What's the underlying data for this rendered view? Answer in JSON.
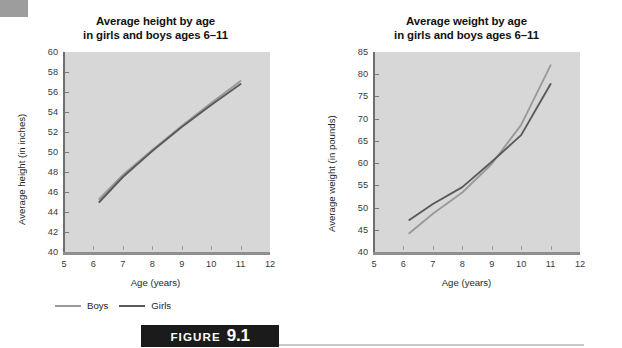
{
  "figure": {
    "word": "FIGURE",
    "number": "9.1"
  },
  "legend": {
    "items": [
      {
        "label": "Boys",
        "color": "#9a9a9a"
      },
      {
        "label": "Girls",
        "color": "#5a5a5a"
      }
    ]
  },
  "colors": {
    "plot_background": "#d7d7d7",
    "boys_line": "#9a9a9a",
    "girls_line": "#5a5a5a",
    "axis": "#6f6f6f",
    "banner": "#1b1b1b"
  },
  "chart_data": [
    {
      "type": "line",
      "id": "height-by-age",
      "title": "Average height by age\nin girls and boys ages 6–11",
      "title_line1": "Average height by age",
      "title_line2": "in girls and boys ages 6–11",
      "xlabel": "Age (years)",
      "ylabel": "Average height (in inches)",
      "xlim": [
        5,
        12
      ],
      "ylim": [
        40,
        60
      ],
      "xticks": [
        5,
        6,
        7,
        8,
        9,
        10,
        11,
        12
      ],
      "yticks": [
        40,
        42,
        44,
        46,
        48,
        50,
        52,
        54,
        56,
        58,
        60
      ],
      "grid": false,
      "legend_position": "below-left",
      "x": [
        6.2,
        7,
        8,
        9,
        10,
        11
      ],
      "series": [
        {
          "name": "Boys",
          "values": [
            45.3,
            47.7,
            50.2,
            52.6,
            54.9,
            57.1
          ]
        },
        {
          "name": "Girls",
          "values": [
            45.0,
            47.5,
            50.1,
            52.5,
            54.7,
            56.8
          ]
        }
      ]
    },
    {
      "type": "line",
      "id": "weight-by-age",
      "title": "Average weight by age\nin girls and boys ages 6–11",
      "title_line1": "Average weight by age",
      "title_line2": "in girls and boys ages 6–11",
      "xlabel": "Age (years)",
      "ylabel": "Average weight (in pounds)",
      "xlim": [
        5,
        12
      ],
      "ylim": [
        40,
        85
      ],
      "xticks": [
        5,
        6,
        7,
        8,
        9,
        10,
        11,
        12
      ],
      "yticks": [
        40,
        45,
        50,
        55,
        60,
        65,
        70,
        75,
        80,
        85
      ],
      "grid": false,
      "legend_position": "below-left",
      "x": [
        6.2,
        7,
        8,
        9,
        10,
        11
      ],
      "series": [
        {
          "name": "Boys",
          "values": [
            44.2,
            48.6,
            53.4,
            59.8,
            68.6,
            82.0
          ]
        },
        {
          "name": "Girls",
          "values": [
            47.2,
            50.8,
            54.6,
            60.3,
            66.3,
            77.8
          ]
        }
      ]
    }
  ]
}
